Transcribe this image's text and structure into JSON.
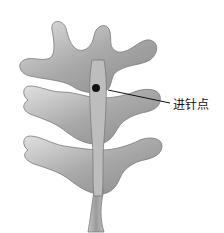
{
  "figure": {
    "annotation": {
      "label": "进针点",
      "marker_color": "#111111"
    },
    "colors": {
      "bone_light": "#d9d9d9",
      "bone_mid": "#a8a8a8",
      "bone_dark": "#6e6e6e",
      "background": "#ffffff"
    }
  }
}
